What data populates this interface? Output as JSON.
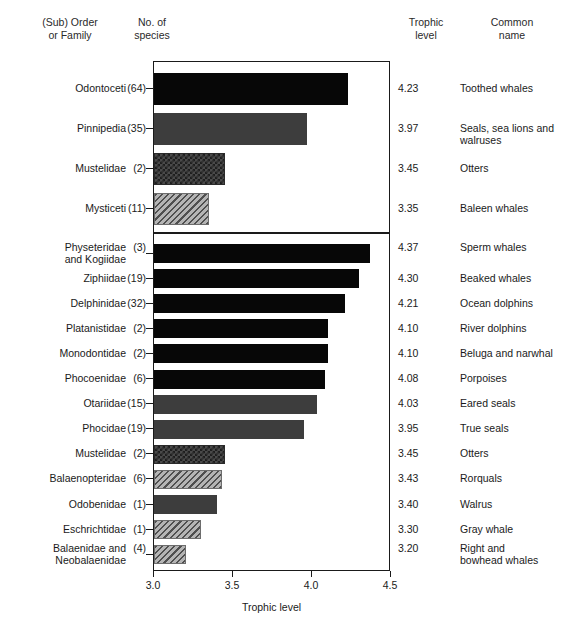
{
  "headers": {
    "taxon": "(Sub) Order\nor Family",
    "num_species": "No. of\nspecies",
    "trophic_level": "Trophic\nlevel",
    "common_name": "Common\nname"
  },
  "axis": {
    "title": "Trophic level",
    "ticks": [
      "3.0",
      "3.5",
      "4.0",
      "4.5"
    ],
    "min": 3.0,
    "max": 4.5
  },
  "chart_data": {
    "type": "bar",
    "title": "",
    "xlabel": "Trophic level",
    "ylabel": "",
    "xlim": [
      3.0,
      4.5
    ],
    "grid": false,
    "orientation": "horizontal",
    "legend": "none",
    "panels": [
      {
        "name": "upper",
        "categories": [
          "Odontoceti",
          "Pinnipedia",
          "Mustelidae",
          "Mysticeti"
        ],
        "values": [
          4.23,
          3.97,
          3.45,
          3.35
        ],
        "num_species": [
          64,
          35,
          2,
          11
        ],
        "common_names": [
          "Toothed whales",
          "Seals, sea lions and walruses",
          "Otters",
          "Baleen whales"
        ],
        "fills": [
          "black",
          "gray",
          "checker",
          "hatch"
        ]
      },
      {
        "name": "lower",
        "categories": [
          "Physeteridae and Kogiidae",
          "Ziphiidae",
          "Delphinidae",
          "Platanistidae",
          "Monodontidae",
          "Phocoenidae",
          "Otariidae",
          "Phocidae",
          "Mustelidae",
          "Balaenopteridae",
          "Odobenidae",
          "Eschrichtidae",
          "Balaenidae and Neobalaenidae"
        ],
        "values": [
          4.37,
          4.3,
          4.21,
          4.1,
          4.1,
          4.08,
          4.03,
          3.95,
          3.45,
          3.43,
          3.4,
          3.3,
          3.2
        ],
        "num_species": [
          3,
          19,
          32,
          2,
          2,
          6,
          15,
          19,
          2,
          6,
          1,
          1,
          4
        ],
        "common_names": [
          "Sperm whales",
          "Beaked whales",
          "Ocean dolphins",
          "River dolphins",
          "Beluga and narwhal",
          "Porpoises",
          "Eared seals",
          "True seals",
          "Otters",
          "Rorquals",
          "Walrus",
          "Gray whale",
          "Right and bowhead whales"
        ],
        "fills": [
          "black",
          "black",
          "black",
          "black",
          "black",
          "black",
          "gray",
          "gray",
          "checker",
          "hatch",
          "gray",
          "hatch",
          "hatch"
        ]
      }
    ]
  },
  "rows_upper": [
    {
      "taxon": "Odontoceti",
      "n": "(64)",
      "trophic": "4.23",
      "common": "Toothed whales"
    },
    {
      "taxon": "Pinnipedia",
      "n": "(35)",
      "trophic": "3.97",
      "common": "Seals, sea lions and\nwalruses"
    },
    {
      "taxon": "Mustelidae",
      "n": "(2)",
      "trophic": "3.45",
      "common": "Otters"
    },
    {
      "taxon": "Mysticeti",
      "n": "(11)",
      "trophic": "3.35",
      "common": "Baleen whales"
    }
  ],
  "rows_lower": [
    {
      "taxon": "Physeteridae\nand Kogiidae",
      "n": "(3)",
      "trophic": "4.37",
      "common": "Sperm whales"
    },
    {
      "taxon": "Ziphiidae",
      "n": "(19)",
      "trophic": "4.30",
      "common": "Beaked whales"
    },
    {
      "taxon": "Delphinidae",
      "n": "(32)",
      "trophic": "4.21",
      "common": "Ocean dolphins"
    },
    {
      "taxon": "Platanistidae",
      "n": "(2)",
      "trophic": "4.10",
      "common": "River dolphins"
    },
    {
      "taxon": "Monodontidae",
      "n": "(2)",
      "trophic": "4.10",
      "common": "Beluga and narwhal"
    },
    {
      "taxon": "Phocoenidae",
      "n": "(6)",
      "trophic": "4.08",
      "common": "Porpoises"
    },
    {
      "taxon": "Otariidae",
      "n": "(15)",
      "trophic": "4.03",
      "common": "Eared seals"
    },
    {
      "taxon": "Phocidae",
      "n": "(19)",
      "trophic": "3.95",
      "common": "True seals"
    },
    {
      "taxon": "Mustelidae",
      "n": "(2)",
      "trophic": "3.45",
      "common": "Otters"
    },
    {
      "taxon": "Balaenopteridae",
      "n": "(6)",
      "trophic": "3.43",
      "common": "Rorquals"
    },
    {
      "taxon": "Odobenidae",
      "n": "(1)",
      "trophic": "3.40",
      "common": "Walrus"
    },
    {
      "taxon": "Eschrichtidae",
      "n": "(1)",
      "trophic": "3.30",
      "common": "Gray whale"
    },
    {
      "taxon": "Balaenidae and\nNeobalaenidae",
      "n": "(4)",
      "trophic": "3.20",
      "common": "Right and\nbowhead whales"
    }
  ]
}
